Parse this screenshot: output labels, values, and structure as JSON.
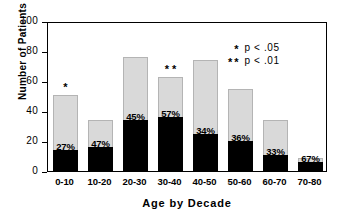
{
  "chart_data": {
    "type": "bar",
    "title": "",
    "xlabel": "Age by Decade",
    "ylabel": "Number of Patients",
    "ylim": [
      0,
      100
    ],
    "yticks": [
      0,
      20,
      40,
      60,
      80,
      100
    ],
    "grid": false,
    "legend_position": "top-right",
    "categories": [
      "0-10",
      "10-20",
      "20-30",
      "30-40",
      "40-50",
      "50-60",
      "60-70",
      "70-80"
    ],
    "series": [
      {
        "name": "Affected (black)",
        "color": "#000000",
        "values": [
          14,
          16,
          34,
          36,
          25,
          20,
          11,
          6
        ]
      },
      {
        "name": "Remainder (gray)",
        "color": "#d9d9d9",
        "values": [
          37,
          18,
          42,
          27,
          49,
          35,
          23,
          3
        ]
      }
    ],
    "totals": [
      51,
      34,
      76,
      63,
      74,
      55,
      34,
      9
    ],
    "data_labels": [
      "27%",
      "47%",
      "45%",
      "57%",
      "34%",
      "36%",
      "33%",
      "67%"
    ],
    "significance_markers": [
      "*",
      "",
      "",
      "**",
      "",
      "",
      "",
      ""
    ],
    "annotations": [
      {
        "marker": "*",
        "text": "p < .05"
      },
      {
        "marker": "**",
        "text": "p < .01"
      }
    ]
  }
}
